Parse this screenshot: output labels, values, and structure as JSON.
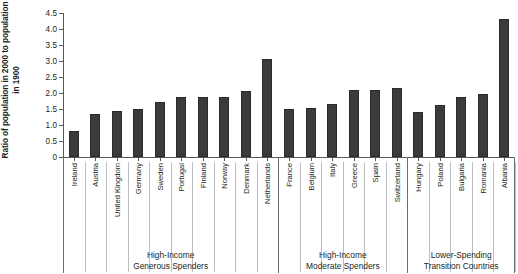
{
  "chart_data": {
    "type": "bar",
    "title": "",
    "subtitle": "",
    "xlabel": "",
    "ylabel": "Ratio of population in 2000 to population in 1900",
    "ylim": [
      0,
      4.5
    ],
    "yticks": [
      "0",
      "0.5",
      "1.0",
      "1.5",
      "2.0",
      "2.5",
      "3.0",
      "3.5",
      "4.0",
      "4.5"
    ],
    "ytick_values": [
      0,
      0.5,
      1.0,
      1.5,
      2.0,
      2.5,
      3.0,
      3.5,
      4.0,
      4.5
    ],
    "grid": false,
    "legend": "none",
    "bar_color": "#3b3b3b",
    "categories": [
      "Ireland",
      "Austria",
      "United Kingdom",
      "Germany",
      "Sweden",
      "Portugal",
      "Finland",
      "Norway",
      "Denmark",
      "Netherlands",
      "France",
      "Belgium",
      "Italy",
      "Greece",
      "Spain",
      "Switzerland",
      "Hungary",
      "Poland",
      "Bulgaria",
      "Romania",
      "Albania"
    ],
    "values": [
      0.82,
      1.35,
      1.43,
      1.49,
      1.72,
      1.87,
      1.88,
      1.88,
      2.05,
      3.05,
      1.5,
      1.53,
      1.65,
      2.1,
      2.08,
      2.15,
      1.42,
      1.63,
      1.87,
      1.97,
      4.3
    ],
    "groups": [
      {
        "label_line1": "High-Income",
        "label_line2": "Generous Spenders",
        "start": 0,
        "end": 9
      },
      {
        "label_line1": "High-Income",
        "label_line2": "Moderate Spenders",
        "start": 10,
        "end": 15
      },
      {
        "label_line1": "Lower-Spending",
        "label_line2": "Transition Countries",
        "start": 16,
        "end": 20
      }
    ]
  }
}
